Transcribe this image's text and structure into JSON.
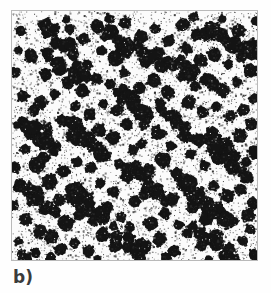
{
  "figure": {
    "label": "b)",
    "panel_title": "",
    "frame": {
      "x": 11,
      "y": 10,
      "width": 247,
      "height": 251
    },
    "colors": {
      "page_background": "#ffffff",
      "panel_background": "#fbfbfb",
      "frame_border": "#b9b9b9",
      "particle": "#141414",
      "speckle": "#2a2a2a",
      "label_text": "#3b3b3b"
    }
  },
  "chart_data": {
    "type": "scatter",
    "title": "",
    "subtitle": "",
    "xlabel": "",
    "ylabel": "",
    "xlim": [
      0,
      247
    ],
    "ylim": [
      0,
      251
    ],
    "grid": false,
    "legend": null,
    "annotations": [
      "b)"
    ],
    "background_speckle": {
      "count": 5200,
      "min_size": 1,
      "max_size": 2,
      "color": "#2a2a2a"
    },
    "particle_style": {
      "fill": "#141414",
      "edge_roughness": 0.22,
      "lobes_min": 7,
      "lobes_max": 12
    },
    "series": [
      {
        "name": "particles",
        "points": [
          {
            "x": 4,
            "y": 62,
            "r": 5
          },
          {
            "x": 5,
            "y": 115,
            "r": 4
          },
          {
            "x": 3,
            "y": 158,
            "r": 6
          },
          {
            "x": 2,
            "y": 196,
            "r": 5
          },
          {
            "x": 6,
            "y": 232,
            "r": 4
          },
          {
            "x": 9,
            "y": 20,
            "r": 5
          },
          {
            "x": 11,
            "y": 86,
            "r": 6
          },
          {
            "x": 13,
            "y": 139,
            "r": 5
          },
          {
            "x": 8,
            "y": 176,
            "r": 7
          },
          {
            "x": 14,
            "y": 210,
            "r": 6
          },
          {
            "x": 10,
            "y": 246,
            "r": 5
          },
          {
            "x": 19,
            "y": 45,
            "r": 7
          },
          {
            "x": 22,
            "y": 100,
            "r": 6
          },
          {
            "x": 17,
            "y": 124,
            "r": 5
          },
          {
            "x": 25,
            "y": 155,
            "r": 8
          },
          {
            "x": 20,
            "y": 186,
            "r": 6
          },
          {
            "x": 28,
            "y": 222,
            "r": 7
          },
          {
            "x": 24,
            "y": 244,
            "r": 5
          },
          {
            "x": 31,
            "y": 14,
            "r": 5
          },
          {
            "x": 34,
            "y": 64,
            "r": 6
          },
          {
            "x": 29,
            "y": 92,
            "r": 7
          },
          {
            "x": 36,
            "y": 118,
            "r": 5
          },
          {
            "x": 32,
            "y": 148,
            "r": 6
          },
          {
            "x": 38,
            "y": 172,
            "r": 8
          },
          {
            "x": 33,
            "y": 200,
            "r": 6
          },
          {
            "x": 40,
            "y": 228,
            "r": 7
          },
          {
            "x": 44,
            "y": 32,
            "r": 6
          },
          {
            "x": 48,
            "y": 58,
            "r": 7
          },
          {
            "x": 43,
            "y": 84,
            "r": 5
          },
          {
            "x": 50,
            "y": 110,
            "r": 6
          },
          {
            "x": 45,
            "y": 136,
            "r": 5
          },
          {
            "x": 52,
            "y": 162,
            "r": 7
          },
          {
            "x": 47,
            "y": 190,
            "r": 6
          },
          {
            "x": 54,
            "y": 214,
            "r": 8
          },
          {
            "x": 49,
            "y": 240,
            "r": 6
          },
          {
            "x": 58,
            "y": 18,
            "r": 5
          },
          {
            "x": 62,
            "y": 44,
            "r": 6
          },
          {
            "x": 57,
            "y": 72,
            "r": 7
          },
          {
            "x": 64,
            "y": 96,
            "r": 5
          },
          {
            "x": 60,
            "y": 126,
            "r": 6
          },
          {
            "x": 66,
            "y": 152,
            "r": 5
          },
          {
            "x": 61,
            "y": 180,
            "r": 7
          },
          {
            "x": 68,
            "y": 206,
            "r": 6
          },
          {
            "x": 63,
            "y": 234,
            "r": 5
          },
          {
            "x": 72,
            "y": 28,
            "r": 6
          },
          {
            "x": 76,
            "y": 54,
            "r": 5
          },
          {
            "x": 71,
            "y": 80,
            "r": 7
          },
          {
            "x": 78,
            "y": 104,
            "r": 6
          },
          {
            "x": 74,
            "y": 132,
            "r": 5
          },
          {
            "x": 80,
            "y": 158,
            "r": 6
          },
          {
            "x": 75,
            "y": 188,
            "r": 7
          },
          {
            "x": 82,
            "y": 212,
            "r": 5
          },
          {
            "x": 77,
            "y": 242,
            "r": 6
          },
          {
            "x": 86,
            "y": 16,
            "r": 7
          },
          {
            "x": 90,
            "y": 40,
            "r": 5
          },
          {
            "x": 85,
            "y": 68,
            "r": 6
          },
          {
            "x": 92,
            "y": 94,
            "r": 5
          },
          {
            "x": 88,
            "y": 120,
            "r": 7
          },
          {
            "x": 94,
            "y": 146,
            "r": 6
          },
          {
            "x": 89,
            "y": 174,
            "r": 5
          },
          {
            "x": 96,
            "y": 198,
            "r": 6
          },
          {
            "x": 91,
            "y": 226,
            "r": 7
          },
          {
            "x": 100,
            "y": 22,
            "r": 6
          },
          {
            "x": 104,
            "y": 48,
            "r": 8
          },
          {
            "x": 99,
            "y": 74,
            "r": 5
          },
          {
            "x": 106,
            "y": 100,
            "r": 6
          },
          {
            "x": 102,
            "y": 128,
            "r": 7
          },
          {
            "x": 108,
            "y": 154,
            "r": 5
          },
          {
            "x": 103,
            "y": 182,
            "r": 6
          },
          {
            "x": 110,
            "y": 208,
            "r": 5
          },
          {
            "x": 105,
            "y": 236,
            "r": 7
          },
          {
            "x": 114,
            "y": 12,
            "r": 6
          },
          {
            "x": 118,
            "y": 36,
            "r": 7
          },
          {
            "x": 113,
            "y": 62,
            "r": 5
          },
          {
            "x": 120,
            "y": 88,
            "r": 8
          },
          {
            "x": 116,
            "y": 114,
            "r": 6
          },
          {
            "x": 122,
            "y": 140,
            "r": 5
          },
          {
            "x": 117,
            "y": 166,
            "r": 7
          },
          {
            "x": 124,
            "y": 192,
            "r": 6
          },
          {
            "x": 119,
            "y": 218,
            "r": 5
          },
          {
            "x": 126,
            "y": 244,
            "r": 6
          },
          {
            "x": 130,
            "y": 26,
            "r": 7
          },
          {
            "x": 134,
            "y": 52,
            "r": 5
          },
          {
            "x": 129,
            "y": 78,
            "r": 6
          },
          {
            "x": 136,
            "y": 106,
            "r": 7
          },
          {
            "x": 131,
            "y": 134,
            "r": 5
          },
          {
            "x": 138,
            "y": 160,
            "r": 6
          },
          {
            "x": 133,
            "y": 186,
            "r": 5
          },
          {
            "x": 140,
            "y": 214,
            "r": 7
          },
          {
            "x": 135,
            "y": 238,
            "r": 6
          },
          {
            "x": 144,
            "y": 18,
            "r": 5
          },
          {
            "x": 148,
            "y": 42,
            "r": 6
          },
          {
            "x": 143,
            "y": 70,
            "r": 7
          },
          {
            "x": 150,
            "y": 98,
            "r": 5
          },
          {
            "x": 146,
            "y": 124,
            "r": 6
          },
          {
            "x": 152,
            "y": 150,
            "r": 8
          },
          {
            "x": 147,
            "y": 178,
            "r": 5
          },
          {
            "x": 154,
            "y": 204,
            "r": 6
          },
          {
            "x": 149,
            "y": 230,
            "r": 7
          },
          {
            "x": 158,
            "y": 30,
            "r": 6
          },
          {
            "x": 162,
            "y": 56,
            "r": 5
          },
          {
            "x": 157,
            "y": 82,
            "r": 7
          },
          {
            "x": 164,
            "y": 108,
            "r": 6
          },
          {
            "x": 160,
            "y": 136,
            "r": 5
          },
          {
            "x": 166,
            "y": 164,
            "r": 6
          },
          {
            "x": 161,
            "y": 190,
            "r": 7
          },
          {
            "x": 168,
            "y": 216,
            "r": 5
          },
          {
            "x": 163,
            "y": 242,
            "r": 6
          },
          {
            "x": 172,
            "y": 14,
            "r": 7
          },
          {
            "x": 176,
            "y": 38,
            "r": 6
          },
          {
            "x": 171,
            "y": 66,
            "r": 5
          },
          {
            "x": 178,
            "y": 92,
            "r": 7
          },
          {
            "x": 174,
            "y": 118,
            "r": 6
          },
          {
            "x": 180,
            "y": 144,
            "r": 5
          },
          {
            "x": 175,
            "y": 172,
            "r": 8
          },
          {
            "x": 182,
            "y": 198,
            "r": 6
          },
          {
            "x": 177,
            "y": 224,
            "r": 5
          },
          {
            "x": 186,
            "y": 24,
            "r": 6
          },
          {
            "x": 190,
            "y": 50,
            "r": 7
          },
          {
            "x": 185,
            "y": 76,
            "r": 5
          },
          {
            "x": 192,
            "y": 102,
            "r": 6
          },
          {
            "x": 188,
            "y": 130,
            "r": 7
          },
          {
            "x": 194,
            "y": 156,
            "r": 5
          },
          {
            "x": 189,
            "y": 184,
            "r": 6
          },
          {
            "x": 196,
            "y": 210,
            "r": 7
          },
          {
            "x": 191,
            "y": 236,
            "r": 6
          },
          {
            "x": 200,
            "y": 16,
            "r": 5
          },
          {
            "x": 204,
            "y": 44,
            "r": 7
          },
          {
            "x": 199,
            "y": 70,
            "r": 6
          },
          {
            "x": 206,
            "y": 96,
            "r": 5
          },
          {
            "x": 202,
            "y": 122,
            "r": 6
          },
          {
            "x": 208,
            "y": 148,
            "r": 7
          },
          {
            "x": 203,
            "y": 176,
            "r": 5
          },
          {
            "x": 210,
            "y": 202,
            "r": 6
          },
          {
            "x": 205,
            "y": 228,
            "r": 8
          },
          {
            "x": 214,
            "y": 28,
            "r": 6
          },
          {
            "x": 218,
            "y": 54,
            "r": 5
          },
          {
            "x": 213,
            "y": 80,
            "r": 7
          },
          {
            "x": 220,
            "y": 106,
            "r": 6
          },
          {
            "x": 216,
            "y": 132,
            "r": 5
          },
          {
            "x": 222,
            "y": 158,
            "r": 6
          },
          {
            "x": 217,
            "y": 186,
            "r": 7
          },
          {
            "x": 224,
            "y": 212,
            "r": 5
          },
          {
            "x": 219,
            "y": 240,
            "r": 6
          },
          {
            "x": 228,
            "y": 20,
            "r": 7
          },
          {
            "x": 232,
            "y": 46,
            "r": 6
          },
          {
            "x": 227,
            "y": 72,
            "r": 5
          },
          {
            "x": 234,
            "y": 100,
            "r": 6
          },
          {
            "x": 230,
            "y": 126,
            "r": 7
          },
          {
            "x": 236,
            "y": 152,
            "r": 5
          },
          {
            "x": 231,
            "y": 180,
            "r": 6
          },
          {
            "x": 238,
            "y": 206,
            "r": 7
          },
          {
            "x": 233,
            "y": 232,
            "r": 5
          },
          {
            "x": 242,
            "y": 34,
            "r": 6
          },
          {
            "x": 240,
            "y": 60,
            "r": 7
          },
          {
            "x": 244,
            "y": 88,
            "r": 5
          },
          {
            "x": 241,
            "y": 114,
            "r": 6
          },
          {
            "x": 245,
            "y": 142,
            "r": 7
          },
          {
            "x": 239,
            "y": 168,
            "r": 5
          },
          {
            "x": 243,
            "y": 194,
            "r": 6
          },
          {
            "x": 240,
            "y": 220,
            "r": 5
          },
          {
            "x": 244,
            "y": 246,
            "r": 6
          },
          {
            "x": 7,
            "y": 40,
            "r": 4
          },
          {
            "x": 16,
            "y": 248,
            "r": 4
          },
          {
            "x": 55,
            "y": 8,
            "r": 4
          },
          {
            "x": 98,
            "y": 8,
            "r": 5
          },
          {
            "x": 183,
            "y": 6,
            "r": 5
          },
          {
            "x": 212,
            "y": 8,
            "r": 4
          },
          {
            "x": 246,
            "y": 10,
            "r": 5
          },
          {
            "x": 39,
            "y": 248,
            "r": 5
          },
          {
            "x": 86,
            "y": 250,
            "r": 4
          },
          {
            "x": 155,
            "y": 248,
            "r": 5
          },
          {
            "x": 198,
            "y": 250,
            "r": 4
          },
          {
            "x": 225,
            "y": 250,
            "r": 5
          }
        ]
      },
      {
        "name": "cluster_bands",
        "description": "Dense diagonal agglomerate chains",
        "bands": [
          {
            "x1": 95,
            "y1": 22,
            "x2": 148,
            "y2": 52,
            "count": 16,
            "r_min": 4,
            "r_max": 8
          },
          {
            "x1": 196,
            "y1": 18,
            "x2": 247,
            "y2": 44,
            "count": 12,
            "r_min": 4,
            "r_max": 8
          },
          {
            "x1": 36,
            "y1": 48,
            "x2": 76,
            "y2": 68,
            "count": 11,
            "r_min": 4,
            "r_max": 7
          },
          {
            "x1": 108,
            "y1": 80,
            "x2": 146,
            "y2": 120,
            "count": 15,
            "r_min": 4,
            "r_max": 9
          },
          {
            "x1": 162,
            "y1": 48,
            "x2": 200,
            "y2": 74,
            "count": 11,
            "r_min": 4,
            "r_max": 7
          },
          {
            "x1": 10,
            "y1": 112,
            "x2": 44,
            "y2": 140,
            "count": 12,
            "r_min": 4,
            "r_max": 8
          },
          {
            "x1": 58,
            "y1": 112,
            "x2": 92,
            "y2": 144,
            "count": 12,
            "r_min": 4,
            "r_max": 8
          },
          {
            "x1": 196,
            "y1": 126,
            "x2": 236,
            "y2": 164,
            "count": 13,
            "r_min": 4,
            "r_max": 8
          },
          {
            "x1": 170,
            "y1": 170,
            "x2": 212,
            "y2": 212,
            "count": 15,
            "r_min": 4,
            "r_max": 9
          },
          {
            "x1": 12,
            "y1": 176,
            "x2": 44,
            "y2": 204,
            "count": 11,
            "r_min": 4,
            "r_max": 7
          },
          {
            "x1": 60,
            "y1": 182,
            "x2": 96,
            "y2": 214,
            "count": 12,
            "r_min": 4,
            "r_max": 8
          },
          {
            "x1": 118,
            "y1": 156,
            "x2": 152,
            "y2": 190,
            "count": 11,
            "r_min": 4,
            "r_max": 8
          },
          {
            "x1": 186,
            "y1": 222,
            "x2": 224,
            "y2": 250,
            "count": 11,
            "r_min": 4,
            "r_max": 7
          },
          {
            "x1": 96,
            "y1": 218,
            "x2": 134,
            "y2": 248,
            "count": 10,
            "r_min": 4,
            "r_max": 7
          },
          {
            "x1": 148,
            "y1": 96,
            "x2": 182,
            "y2": 124,
            "count": 10,
            "r_min": 4,
            "r_max": 7
          },
          {
            "x1": 30,
            "y1": 14,
            "x2": 60,
            "y2": 34,
            "count": 8,
            "r_min": 4,
            "r_max": 7
          }
        ]
      }
    ]
  }
}
